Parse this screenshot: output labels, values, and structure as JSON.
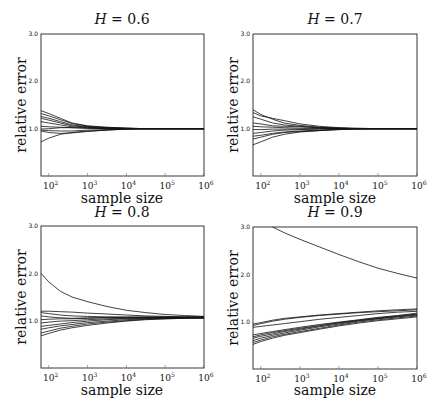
{
  "chart_data": [
    {
      "type": "line",
      "title": "H = 0.6",
      "title_var": "H",
      "title_value": "0.6",
      "xlabel": "sample size",
      "ylabel": "relative error",
      "xscale": "log",
      "xlim_log10": [
        1.8,
        6
      ],
      "ylim": [
        0,
        3.0
      ],
      "yticks": [
        "1.0",
        "2.0",
        "3.0"
      ],
      "xticks": [
        "10^2",
        "10^3",
        "10^4",
        "10^5",
        "10^6"
      ],
      "grid": false,
      "x_log10": [
        1.8,
        2.0,
        2.3,
        2.6,
        3.0,
        3.5,
        4.0,
        4.5,
        5.0,
        6.0
      ],
      "series": [
        {
          "name": "run1",
          "values": [
            1.38,
            1.32,
            1.22,
            1.12,
            1.06,
            1.03,
            1.01,
            1.0,
            1.0,
            1.0
          ]
        },
        {
          "name": "run2",
          "values": [
            1.32,
            1.27,
            1.19,
            1.11,
            1.05,
            1.02,
            1.01,
            1.0,
            1.0,
            1.0
          ]
        },
        {
          "name": "run3",
          "values": [
            1.26,
            1.22,
            1.15,
            1.08,
            1.04,
            1.02,
            1.01,
            1.0,
            1.0,
            1.0
          ]
        },
        {
          "name": "run4",
          "values": [
            1.22,
            1.18,
            1.12,
            1.06,
            1.03,
            1.01,
            1.0,
            1.0,
            1.0,
            1.0
          ]
        },
        {
          "name": "run5",
          "values": [
            1.15,
            1.12,
            1.08,
            1.04,
            1.02,
            1.01,
            1.0,
            1.0,
            1.0,
            1.0
          ]
        },
        {
          "name": "run6",
          "values": [
            1.05,
            1.04,
            1.03,
            1.02,
            1.01,
            1.0,
            1.0,
            1.0,
            1.0,
            1.0
          ]
        },
        {
          "name": "run7",
          "values": [
            0.99,
            1.0,
            1.02,
            1.02,
            1.01,
            1.0,
            1.0,
            1.0,
            1.0,
            1.0
          ]
        },
        {
          "name": "run8",
          "values": [
            0.97,
            0.96,
            0.95,
            0.95,
            0.97,
            0.98,
            0.99,
            1.0,
            1.0,
            1.0
          ]
        },
        {
          "name": "run9",
          "values": [
            0.95,
            0.92,
            0.9,
            0.91,
            0.94,
            0.97,
            0.99,
            1.0,
            1.0,
            1.0
          ]
        },
        {
          "name": "run10",
          "values": [
            0.72,
            0.8,
            0.88,
            0.92,
            0.95,
            0.97,
            0.99,
            1.0,
            1.0,
            1.0
          ]
        }
      ]
    },
    {
      "type": "line",
      "title": "H = 0.7",
      "title_var": "H",
      "title_value": "0.7",
      "xlabel": "sample size",
      "ylabel": "relative error",
      "xscale": "log",
      "xlim_log10": [
        1.8,
        6
      ],
      "ylim": [
        0,
        3.0
      ],
      "yticks": [
        "1.0",
        "2.0",
        "3.0"
      ],
      "xticks": [
        "10^2",
        "10^3",
        "10^4",
        "10^5",
        "10^6"
      ],
      "grid": false,
      "x_log10": [
        1.8,
        2.0,
        2.3,
        2.6,
        3.0,
        3.5,
        4.0,
        4.5,
        5.0,
        6.0
      ],
      "series": [
        {
          "name": "run1",
          "values": [
            1.4,
            1.3,
            1.2,
            1.12,
            1.07,
            1.03,
            1.01,
            1.0,
            1.0,
            1.0
          ]
        },
        {
          "name": "run2",
          "values": [
            1.34,
            1.27,
            1.22,
            1.17,
            1.1,
            1.05,
            1.02,
            1.01,
            1.0,
            1.0
          ]
        },
        {
          "name": "run3",
          "values": [
            1.25,
            1.2,
            1.12,
            1.08,
            1.05,
            1.02,
            1.01,
            1.0,
            1.0,
            1.0
          ]
        },
        {
          "name": "run4",
          "values": [
            1.12,
            1.1,
            1.06,
            1.05,
            1.04,
            1.02,
            1.01,
            1.0,
            1.0,
            1.0
          ]
        },
        {
          "name": "run5",
          "values": [
            1.05,
            1.04,
            1.03,
            1.02,
            1.01,
            1.01,
            1.0,
            1.0,
            1.0,
            1.0
          ]
        },
        {
          "name": "run6",
          "values": [
            0.98,
            0.98,
            0.99,
            0.99,
            0.99,
            1.0,
            1.0,
            1.0,
            1.0,
            1.0
          ]
        },
        {
          "name": "run7",
          "values": [
            0.9,
            0.92,
            0.95,
            0.97,
            0.98,
            0.99,
            1.0,
            1.0,
            1.0,
            1.0
          ]
        },
        {
          "name": "run8",
          "values": [
            0.84,
            0.86,
            0.9,
            0.93,
            0.95,
            0.97,
            0.99,
            1.0,
            1.0,
            1.0
          ]
        },
        {
          "name": "run9",
          "values": [
            0.78,
            0.82,
            0.88,
            0.92,
            0.94,
            0.96,
            0.98,
            1.0,
            1.0,
            1.0
          ]
        },
        {
          "name": "run10",
          "values": [
            0.66,
            0.72,
            0.82,
            0.88,
            0.93,
            0.96,
            0.98,
            0.99,
            1.0,
            1.0
          ]
        }
      ]
    },
    {
      "type": "line",
      "title": "H = 0.8",
      "title_var": "H",
      "title_value": "0.8",
      "xlabel": "sample size",
      "ylabel": "relative error",
      "xscale": "log",
      "xlim_log10": [
        1.8,
        6
      ],
      "ylim": [
        0,
        3.0
      ],
      "yticks": [
        "1.0",
        "2.0",
        "3.0"
      ],
      "xticks": [
        "10^2",
        "10^3",
        "10^4",
        "10^5",
        "10^6"
      ],
      "grid": false,
      "x_log10": [
        1.8,
        2.0,
        2.3,
        2.6,
        3.0,
        3.5,
        4.0,
        4.5,
        5.0,
        5.5,
        6.0
      ],
      "series": [
        {
          "name": "run1",
          "values": [
            2.0,
            1.82,
            1.62,
            1.5,
            1.4,
            1.3,
            1.22,
            1.17,
            1.13,
            1.11,
            1.09
          ]
        },
        {
          "name": "run2",
          "values": [
            1.2,
            1.2,
            1.19,
            1.18,
            1.16,
            1.14,
            1.12,
            1.1,
            1.09,
            1.08,
            1.08
          ]
        },
        {
          "name": "run3",
          "values": [
            1.17,
            1.15,
            1.12,
            1.1,
            1.09,
            1.08,
            1.08,
            1.08,
            1.08,
            1.08,
            1.08
          ]
        },
        {
          "name": "run4",
          "values": [
            1.1,
            1.08,
            1.06,
            1.05,
            1.06,
            1.07,
            1.07,
            1.07,
            1.07,
            1.07,
            1.07
          ]
        },
        {
          "name": "run5",
          "values": [
            1.02,
            1.03,
            1.04,
            1.04,
            1.05,
            1.06,
            1.06,
            1.07,
            1.07,
            1.07,
            1.07
          ]
        },
        {
          "name": "run6",
          "values": [
            0.95,
            0.97,
            0.99,
            1.0,
            1.02,
            1.04,
            1.05,
            1.06,
            1.06,
            1.07,
            1.07
          ]
        },
        {
          "name": "run7",
          "values": [
            0.88,
            0.9,
            0.93,
            0.96,
            0.99,
            1.02,
            1.04,
            1.05,
            1.06,
            1.06,
            1.06
          ]
        },
        {
          "name": "run8",
          "values": [
            0.82,
            0.85,
            0.89,
            0.92,
            0.96,
            0.99,
            1.02,
            1.04,
            1.05,
            1.06,
            1.06
          ]
        },
        {
          "name": "run9",
          "values": [
            0.74,
            0.78,
            0.84,
            0.88,
            0.93,
            0.97,
            1.0,
            1.03,
            1.04,
            1.05,
            1.06
          ]
        },
        {
          "name": "run10",
          "values": [
            0.68,
            0.73,
            0.8,
            0.85,
            0.9,
            0.95,
            0.99,
            1.02,
            1.04,
            1.05,
            1.05
          ]
        }
      ]
    },
    {
      "type": "line",
      "title": "H = 0.9",
      "title_var": "H",
      "title_value": "0.9",
      "xlabel": "sample size",
      "ylabel": "relative error",
      "xscale": "log",
      "xlim_log10": [
        1.8,
        6
      ],
      "ylim": [
        0,
        3.0
      ],
      "yticks": [
        "1.0",
        "2.0",
        "3.0"
      ],
      "xticks": [
        "10^2",
        "10^3",
        "10^4",
        "10^5",
        "10^6"
      ],
      "grid": false,
      "x_log10": [
        1.8,
        2.0,
        2.3,
        2.6,
        3.0,
        3.5,
        4.0,
        4.5,
        5.0,
        5.5,
        6.0
      ],
      "series": [
        {
          "name": "run1",
          "values": [
            null,
            null,
            3.0,
            2.88,
            2.74,
            2.58,
            2.42,
            2.27,
            2.13,
            2.02,
            1.92
          ]
        },
        {
          "name": "run2",
          "values": [
            0.95,
            0.98,
            1.03,
            1.07,
            1.1,
            1.14,
            1.17,
            1.2,
            1.23,
            1.25,
            1.27
          ]
        },
        {
          "name": "run3",
          "values": [
            0.92,
            0.96,
            1.01,
            1.05,
            1.09,
            1.13,
            1.16,
            1.19,
            1.21,
            1.23,
            1.25
          ]
        },
        {
          "name": "run4",
          "values": [
            0.88,
            0.9,
            0.93,
            0.96,
            1.0,
            1.05,
            1.09,
            1.13,
            1.17,
            1.2,
            1.22
          ]
        },
        {
          "name": "run5",
          "values": [
            0.72,
            0.75,
            0.79,
            0.83,
            0.88,
            0.94,
            0.99,
            1.04,
            1.09,
            1.13,
            1.18
          ]
        },
        {
          "name": "run6",
          "values": [
            0.68,
            0.72,
            0.77,
            0.81,
            0.86,
            0.92,
            0.98,
            1.03,
            1.08,
            1.12,
            1.16
          ]
        },
        {
          "name": "run7",
          "values": [
            0.65,
            0.69,
            0.74,
            0.79,
            0.84,
            0.91,
            0.97,
            1.02,
            1.07,
            1.11,
            1.15
          ]
        },
        {
          "name": "run8",
          "values": [
            0.6,
            0.65,
            0.71,
            0.76,
            0.82,
            0.89,
            0.95,
            1.01,
            1.06,
            1.1,
            1.14
          ]
        },
        {
          "name": "run9",
          "values": [
            0.56,
            0.61,
            0.68,
            0.73,
            0.79,
            0.86,
            0.93,
            0.99,
            1.04,
            1.08,
            1.12
          ]
        },
        {
          "name": "run10",
          "values": [
            0.52,
            0.58,
            0.65,
            0.71,
            0.77,
            0.84,
            0.91,
            0.97,
            1.02,
            1.06,
            1.1
          ]
        }
      ]
    }
  ],
  "panels": [
    {
      "title_var": "H",
      "title_eq": " = ",
      "title_value": "0.6",
      "xlabel": "sample size",
      "ylabel": "relative error",
      "yticks": [
        "1.0",
        "2.0",
        "3.0"
      ],
      "xticks": [
        {
          "base": "10",
          "exp": "2"
        },
        {
          "base": "10",
          "exp": "3"
        },
        {
          "base": "10",
          "exp": "4"
        },
        {
          "base": "10",
          "exp": "5"
        },
        {
          "base": "10",
          "exp": "6"
        }
      ]
    },
    {
      "title_var": "H",
      "title_eq": " = ",
      "title_value": "0.7",
      "xlabel": "sample size",
      "ylabel": "relative error",
      "yticks": [
        "1.0",
        "2.0",
        "3.0"
      ],
      "xticks": [
        {
          "base": "10",
          "exp": "2"
        },
        {
          "base": "10",
          "exp": "3"
        },
        {
          "base": "10",
          "exp": "4"
        },
        {
          "base": "10",
          "exp": "5"
        },
        {
          "base": "10",
          "exp": "6"
        }
      ]
    },
    {
      "title_var": "H",
      "title_eq": " = ",
      "title_value": "0.8",
      "xlabel": "sample size",
      "ylabel": "relative error",
      "yticks": [
        "1.0",
        "2.0",
        "3.0"
      ],
      "xticks": [
        {
          "base": "10",
          "exp": "2"
        },
        {
          "base": "10",
          "exp": "3"
        },
        {
          "base": "10",
          "exp": "4"
        },
        {
          "base": "10",
          "exp": "5"
        },
        {
          "base": "10",
          "exp": "6"
        }
      ]
    },
    {
      "title_var": "H",
      "title_eq": " = ",
      "title_value": "0.9",
      "xlabel": "sample size",
      "ylabel": "relative error",
      "yticks": [
        "1.0",
        "2.0",
        "3.0"
      ],
      "xticks": [
        {
          "base": "10",
          "exp": "2"
        },
        {
          "base": "10",
          "exp": "3"
        },
        {
          "base": "10",
          "exp": "4"
        },
        {
          "base": "10",
          "exp": "5"
        },
        {
          "base": "10",
          "exp": "6"
        }
      ]
    }
  ]
}
